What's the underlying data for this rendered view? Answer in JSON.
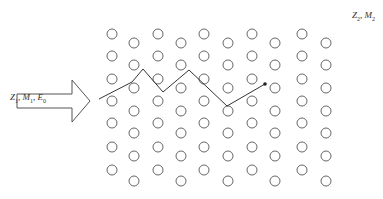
{
  "diagram": {
    "type": "ion-implantation-trajectory",
    "target": {
      "label_parts": [
        {
          "sym": "Z",
          "sub": "2"
        },
        {
          "sym": "M",
          "sub": "2"
        }
      ],
      "lattice": {
        "columns_x": [
          112,
          134,
          158,
          181,
          204,
          228,
          252,
          275,
          302,
          326
        ],
        "odd_col_rows_y": [
          34,
          56,
          79,
          101,
          123,
          147,
          170
        ],
        "even_col_rows_y": [
          43,
          65,
          88,
          111,
          133,
          156,
          181
        ],
        "atom_radius": 5,
        "stroke": "#555555"
      }
    },
    "ion_beam": {
      "label_parts": [
        {
          "sym": "Z",
          "sub": "1"
        },
        {
          "sym": "M",
          "sub": "1"
        },
        {
          "sym": "E",
          "sub": "0"
        }
      ],
      "arrow_color": "#555555"
    },
    "trajectory": {
      "points": [
        [
          99,
          99
        ],
        [
          132,
          82
        ],
        [
          143,
          69
        ],
        [
          163,
          92
        ],
        [
          189,
          70
        ],
        [
          227,
          106
        ],
        [
          265,
          84
        ]
      ],
      "end_dot": [
        265,
        84
      ],
      "color": "#333333"
    }
  }
}
